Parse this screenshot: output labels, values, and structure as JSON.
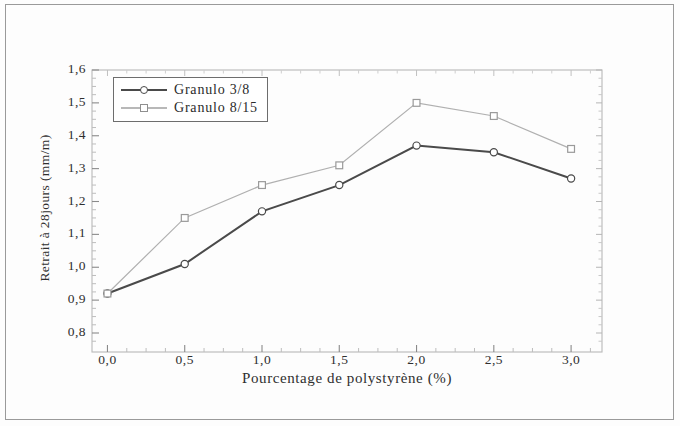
{
  "chart_data": {
    "type": "line",
    "title": "",
    "xlabel": "Pourcentage de polystyrène (%)",
    "ylabel": "Retrait à 28jours (mm/m)",
    "x": [
      0.0,
      0.5,
      1.0,
      1.5,
      2.0,
      2.5,
      3.0
    ],
    "xtick_labels": [
      "0,0",
      "0,5",
      "1,0",
      "1,5",
      "2,0",
      "2,5",
      "3,0"
    ],
    "ytick_labels": [
      "0,8",
      "0,9",
      "1,0",
      "1,1",
      "1,2",
      "1,3",
      "1,4",
      "1,5",
      "1,6"
    ],
    "ytick_values": [
      0.8,
      0.9,
      1.0,
      1.1,
      1.2,
      1.3,
      1.4,
      1.5,
      1.6
    ],
    "xlim": [
      -0.1,
      3.2
    ],
    "ylim": [
      0.75,
      1.6
    ],
    "grid": false,
    "minor_ticks": true,
    "legend_position": "upper left",
    "series": [
      {
        "name": "Granulo 3/8",
        "marker": "circle-open",
        "color": "#4a4a4a",
        "values": [
          0.92,
          1.01,
          1.17,
          1.25,
          1.37,
          1.35,
          1.27
        ]
      },
      {
        "name": "Granulo 8/15",
        "marker": "square-open",
        "color": "#b0b0b0",
        "values": [
          0.92,
          1.15,
          1.25,
          1.31,
          1.5,
          1.46,
          1.36
        ]
      }
    ]
  },
  "legend": {
    "items": [
      {
        "label": "Granulo 3/8"
      },
      {
        "label": "Granulo 8/15"
      }
    ]
  },
  "axes": {
    "x_title": "Pourcentage de polystyrène (%)",
    "y_title": "Retrait à 28jours (mm/m)"
  }
}
